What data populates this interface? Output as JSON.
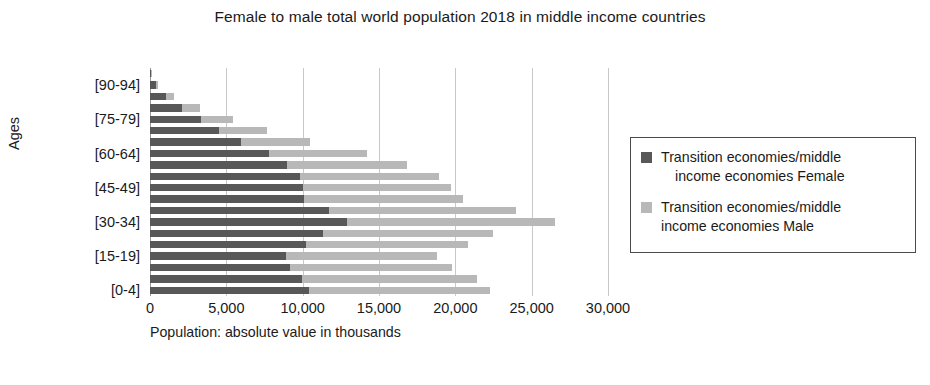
{
  "chart_data": {
    "type": "bar",
    "title": "Female to male total world population 2018 in middle income countries",
    "title_line1": "Female to male total world population 2018 in middle income",
    "title_line2": "countries",
    "xlabel": "Population: absolute value in thousands",
    "ylabel": "Ages",
    "orientation": "horizontal",
    "stacked": true,
    "grid": true,
    "legend_position": "right",
    "xlim": [
      0,
      30000
    ],
    "xticks": [
      0,
      5000,
      10000,
      15000,
      20000,
      25000,
      30000
    ],
    "xtick_labels": [
      "0",
      "5,000",
      "10,000",
      "15,000",
      "20,000",
      "25,000",
      "30,000"
    ],
    "categories": [
      "[0-4]",
      "[5-9]",
      "[10-14]",
      "[15-19]",
      "[20-24]",
      "[25-29]",
      "[30-34]",
      "[35-39]",
      "[40-44]",
      "[45-49]",
      "[50-54]",
      "[55-59]",
      "[60-64]",
      "[65-69]",
      "[70-74]",
      "[75-79]",
      "[80-84]",
      "[85-89]",
      "[90-94]",
      "[95+]"
    ],
    "visible_ytick_labels": [
      "[0-4]",
      "[15-19]",
      "[30-34]",
      "[45-49]",
      "[60-64]",
      "[75-79]",
      "[90-94]"
    ],
    "series": [
      {
        "name": "Transition economies/middle income economies Female",
        "color": "#585858",
        "values": [
          10400,
          9950,
          9200,
          8900,
          10200,
          11300,
          12900,
          11700,
          10100,
          10000,
          9850,
          8950,
          7800,
          5950,
          4500,
          3350,
          2100,
          1050,
          380,
          90
        ]
      },
      {
        "name": "Transition economies/middle income economies Male",
        "color": "#b8b8b8",
        "values": [
          11900,
          11500,
          10600,
          9900,
          10600,
          11200,
          13600,
          12300,
          10400,
          9700,
          9050,
          7900,
          6400,
          4500,
          3150,
          2100,
          1150,
          500,
          160,
          30
        ]
      }
    ],
    "totals": [
      22300,
      21450,
      19800,
      18800,
      20800,
      22500,
      26500,
      24000,
      20500,
      19700,
      18900,
      16850,
      14200,
      10450,
      7650,
      5450,
      3250,
      1550,
      540,
      120
    ]
  },
  "legend": {
    "items": [
      {
        "swatch": "female",
        "line1": "Transition economies/middle",
        "line2": "income economies Female"
      },
      {
        "swatch": "male",
        "line1": "Transition economies/middle",
        "line2": "income economies Male"
      }
    ]
  }
}
